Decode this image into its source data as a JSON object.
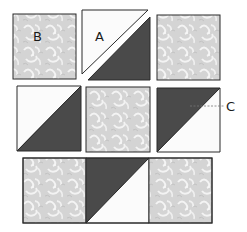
{
  "diagram": {
    "labels": {
      "a": "A",
      "b": "B",
      "c": "C"
    },
    "colors": {
      "print_fill": "#d6d6d6",
      "print_swirl": "#f2f2f2",
      "dark_fill": "#4a4a4a",
      "light_fill": "#fbfbfb",
      "outline": "#2a2a2a",
      "leader": "#777777"
    },
    "rows": [
      {
        "row": 1,
        "units": [
          {
            "type": "print-square",
            "label": "B"
          },
          {
            "type": "half-square-triangle-separated",
            "light": "top-left",
            "dark": "bottom-right",
            "label": "A"
          },
          {
            "type": "print-square"
          }
        ]
      },
      {
        "row": 2,
        "units": [
          {
            "type": "half-square-triangle",
            "light": "top-left",
            "dark": "bottom-right"
          },
          {
            "type": "print-square"
          },
          {
            "type": "half-square-triangle",
            "light": "bottom-right",
            "dark": "top-left",
            "label": "C"
          }
        ]
      },
      {
        "row": 3,
        "joined": true,
        "units": [
          {
            "type": "print-square"
          },
          {
            "type": "half-square-triangle",
            "light": "bottom-right",
            "dark": "top-left"
          },
          {
            "type": "print-square"
          }
        ]
      }
    ]
  }
}
